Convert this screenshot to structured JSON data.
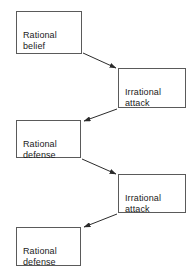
{
  "diagram": {
    "type": "flowchart",
    "title": "",
    "background_color": "#ffffff",
    "box_border_color": "#5a5a5a",
    "text_color": "#1a1a1a",
    "arrow_color": "#2b2b2b",
    "nodes": [
      {
        "id": "rational-belief",
        "label": "Rational\nbelief",
        "x": 16,
        "y": 11,
        "w": 66,
        "h": 43
      },
      {
        "id": "irrational-attack-1",
        "label": "Irrational\nattack",
        "x": 118,
        "y": 68,
        "w": 68,
        "h": 40
      },
      {
        "id": "rational-defense-1",
        "label": "Rational\ndefense",
        "x": 16,
        "y": 120,
        "w": 65,
        "h": 38
      },
      {
        "id": "irrational-attack-2",
        "label": "Irrational\nattack",
        "x": 118,
        "y": 174,
        "w": 68,
        "h": 39
      },
      {
        "id": "rational-defense-2",
        "label": "Rational\ndefense",
        "x": 16,
        "y": 227,
        "w": 65,
        "h": 39
      }
    ],
    "edges": [
      {
        "id": "edge-belief-to-attack-1",
        "from": "rational-belief",
        "to": "irrational-attack-1",
        "label": "",
        "x1": 83,
        "y1": 53,
        "x2": 116,
        "y2": 68
      },
      {
        "id": "edge-attack-1-to-defense-1",
        "from": "irrational-attack-1",
        "to": "rational-defense-1",
        "label": "",
        "x1": 117,
        "y1": 109,
        "x2": 84,
        "y2": 121
      },
      {
        "id": "edge-defense-1-to-attack-2",
        "from": "rational-defense-1",
        "to": "irrational-attack-2",
        "label": "",
        "x1": 82,
        "y1": 159,
        "x2": 116,
        "y2": 174
      },
      {
        "id": "edge-attack-2-to-defense-2",
        "from": "irrational-attack-2",
        "to": "rational-defense-2",
        "label": "",
        "x1": 117,
        "y1": 214,
        "x2": 84,
        "y2": 227
      }
    ]
  }
}
